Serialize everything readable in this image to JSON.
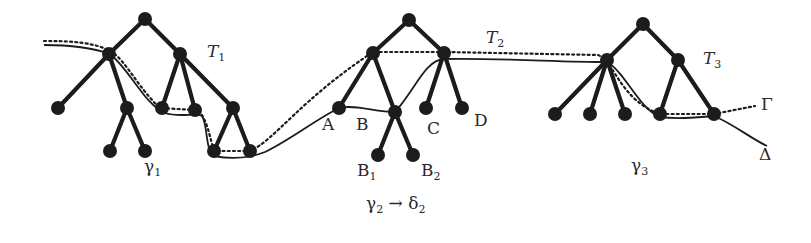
{
  "diagram": {
    "trees": [
      {
        "name": "T",
        "sub": "1",
        "label_pos": [
          207,
          43
        ]
      },
      {
        "name": "T",
        "sub": "2",
        "label_pos": [
          486,
          29
        ]
      },
      {
        "name": "T",
        "sub": "3",
        "label_pos": [
          703,
          50
        ]
      }
    ],
    "node_labels": [
      {
        "text": "A",
        "sub": "",
        "pos": [
          322,
          116
        ]
      },
      {
        "text": "B",
        "sub": "",
        "pos": [
          356,
          116
        ]
      },
      {
        "text": "C",
        "sub": "",
        "pos": [
          427,
          120
        ]
      },
      {
        "text": "D",
        "sub": "",
        "pos": [
          474,
          112
        ]
      },
      {
        "text": "B",
        "sub": "1",
        "pos": [
          357,
          162
        ]
      },
      {
        "text": "B",
        "sub": "2",
        "pos": [
          421,
          162
        ]
      }
    ],
    "region_labels": [
      {
        "id": "gamma1",
        "text": "γ",
        "sub": "1",
        "pos": [
          144,
          158
        ]
      },
      {
        "id": "gamma2-delta2",
        "text": "γ",
        "sub": "2",
        "arrow": " → ",
        "text2": "δ",
        "sub2": "2",
        "pos": [
          366,
          195
        ]
      },
      {
        "id": "gamma3",
        "text": "γ",
        "sub": "3",
        "pos": [
          631,
          157
        ]
      }
    ],
    "curve_labels": {
      "gamma": {
        "text": "Γ",
        "pos": [
          761,
          96
        ],
        "style": "dotted"
      },
      "delta": {
        "text": "Δ",
        "pos": [
          759,
          146
        ],
        "style": "solid"
      }
    },
    "colors": {
      "ink": "#1c1c1c",
      "text": "#2a2a2a",
      "background": "#ffffff"
    }
  }
}
